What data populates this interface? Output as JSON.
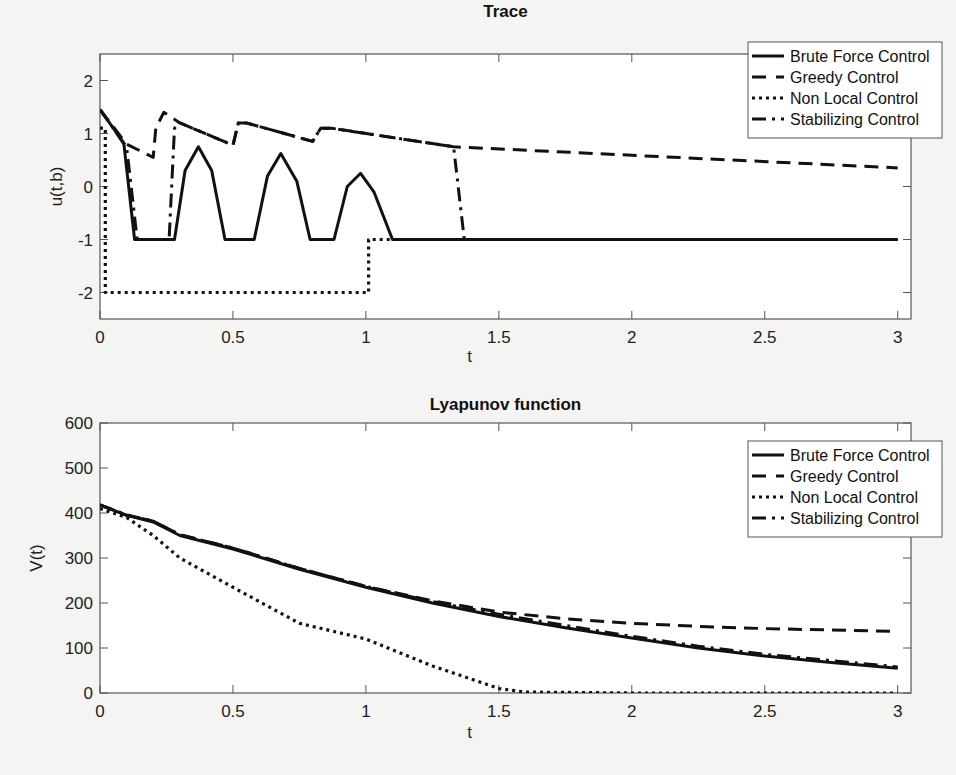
{
  "chart_data": [
    {
      "type": "line",
      "title": "Trace",
      "xlabel": "t",
      "ylabel": "u(t,b)",
      "xlim": [
        0,
        3.05
      ],
      "ylim": [
        -2.5,
        2.5
      ],
      "xticks": [
        "0",
        "0.5",
        "1",
        "1.5",
        "2",
        "2.5",
        "3"
      ],
      "yticks": [
        "-2",
        "-1",
        "0",
        "1",
        "2"
      ],
      "grid": false,
      "legend_position": "upper right",
      "series": [
        {
          "name": "Brute Force Control",
          "style": "solid",
          "x": [
            0,
            0.05,
            0.09,
            0.13,
            0.15,
            0.28,
            0.32,
            0.37,
            0.42,
            0.47,
            0.58,
            0.63,
            0.68,
            0.74,
            0.79,
            0.88,
            0.93,
            0.98,
            1.03,
            1.1,
            3.0
          ],
          "y": [
            1.45,
            1.1,
            0.8,
            -1,
            -1,
            -1,
            0.3,
            0.75,
            0.3,
            -1,
            -1,
            0.2,
            0.62,
            0.1,
            -1,
            -1,
            0.0,
            0.25,
            -0.1,
            -1,
            -1
          ]
        },
        {
          "name": "Greedy Control",
          "style": "dashed",
          "x": [
            0,
            0.1,
            0.2,
            0.21,
            0.24,
            0.3,
            0.5,
            0.52,
            0.55,
            0.8,
            0.83,
            0.87,
            1.33,
            3.0
          ],
          "y": [
            1.45,
            0.8,
            0.55,
            1.1,
            1.4,
            1.2,
            0.78,
            1.2,
            1.2,
            0.85,
            1.1,
            1.1,
            0.75,
            0.35
          ]
        },
        {
          "name": "Non Local Control",
          "style": "dotted",
          "x": [
            0,
            0.02,
            0.02,
            1.01,
            1.01,
            3.0
          ],
          "y": [
            1.1,
            1.1,
            -2,
            -2,
            -1,
            -1
          ]
        },
        {
          "name": "Stabilizing Control",
          "style": "dash-dot",
          "x": [
            0,
            0.1,
            0.14,
            0.26,
            0.28,
            0.3,
            0.5,
            0.52,
            0.55,
            0.8,
            0.83,
            0.87,
            1.33,
            1.37,
            3.0
          ],
          "y": [
            1.45,
            0.75,
            -1,
            -1,
            1.1,
            1.2,
            0.78,
            1.2,
            1.2,
            0.85,
            1.1,
            1.1,
            0.75,
            -1,
            -1
          ]
        }
      ]
    },
    {
      "type": "line",
      "title": "Lyapunov function",
      "xlabel": "t",
      "ylabel": "V(t)",
      "xlim": [
        0,
        3.05
      ],
      "ylim": [
        0,
        600
      ],
      "xticks": [
        "0",
        "0.5",
        "1",
        "1.5",
        "2",
        "2.5",
        "3"
      ],
      "yticks": [
        "0",
        "100",
        "200",
        "300",
        "400",
        "500",
        "600"
      ],
      "grid": false,
      "legend_position": "upper right",
      "series": [
        {
          "name": "Brute Force Control",
          "style": "solid",
          "x": [
            0,
            0.1,
            0.2,
            0.3,
            0.5,
            0.75,
            1.0,
            1.25,
            1.5,
            1.75,
            2.0,
            2.25,
            2.5,
            2.75,
            3.0
          ],
          "y": [
            418,
            395,
            380,
            350,
            320,
            275,
            235,
            200,
            170,
            145,
            122,
            100,
            82,
            68,
            55
          ]
        },
        {
          "name": "Greedy Control",
          "style": "dashed",
          "x": [
            0,
            0.1,
            0.2,
            0.3,
            0.5,
            0.75,
            1.0,
            1.25,
            1.5,
            1.75,
            2.0,
            2.25,
            2.5,
            2.75,
            3.0
          ],
          "y": [
            418,
            395,
            382,
            352,
            322,
            277,
            237,
            205,
            180,
            165,
            155,
            148,
            143,
            140,
            137
          ]
        },
        {
          "name": "Non Local Control",
          "style": "dotted",
          "x": [
            0,
            0.1,
            0.2,
            0.3,
            0.5,
            0.75,
            1.0,
            1.25,
            1.5,
            1.6,
            2.0,
            2.5,
            3.0
          ],
          "y": [
            410,
            390,
            350,
            300,
            235,
            155,
            120,
            60,
            10,
            2,
            0,
            0,
            0
          ]
        },
        {
          "name": "Stabilizing Control",
          "style": "dash-dot",
          "x": [
            0,
            0.1,
            0.2,
            0.3,
            0.5,
            0.75,
            1.0,
            1.25,
            1.5,
            1.75,
            2.0,
            2.25,
            2.5,
            2.75,
            3.0
          ],
          "y": [
            418,
            396,
            382,
            352,
            322,
            277,
            237,
            203,
            175,
            150,
            126,
            104,
            86,
            72,
            58
          ]
        }
      ]
    }
  ]
}
